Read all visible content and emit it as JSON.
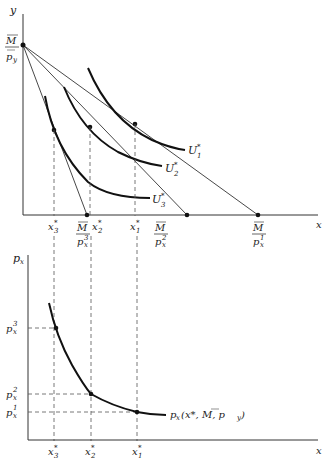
{
  "top_panel": {
    "y_axis_label": "y",
    "x_axis_label": "x",
    "y_intercept_label": {
      "num": "M",
      "den": "p",
      "den_sub": "y"
    },
    "budget_intercepts": [
      {
        "num": "M",
        "den": "p",
        "den_sub": "x",
        "den_sup": "3"
      },
      {
        "num": "M",
        "den": "p",
        "den_sub": "x",
        "den_sup": "2"
      },
      {
        "num": "M",
        "den": "p",
        "den_sub": "x",
        "den_sup": "1"
      }
    ],
    "indifference_curves": [
      {
        "label": "U",
        "sub": "1",
        "sup": "*"
      },
      {
        "label": "U",
        "sub": "2",
        "sup": "*"
      },
      {
        "label": "U",
        "sub": "3",
        "sup": "*"
      }
    ],
    "x_ticks": [
      {
        "label": "x",
        "sub": "3",
        "sup": "*"
      },
      {
        "label": "x",
        "sub": "2",
        "sup": "*"
      },
      {
        "label": "x",
        "sub": "1",
        "sup": "*"
      }
    ]
  },
  "bottom_panel": {
    "y_axis_label": "p",
    "y_axis_sub": "x",
    "x_axis_label": "x",
    "price_ticks": [
      {
        "label": "p",
        "sub": "x",
        "sup": "3"
      },
      {
        "label": "p",
        "sub": "x",
        "sup": "2"
      },
      {
        "label": "p",
        "sub": "x",
        "sup": "1"
      }
    ],
    "x_ticks": [
      {
        "label": "x",
        "sub": "3",
        "sup": "*"
      },
      {
        "label": "x",
        "sub": "2",
        "sup": "*"
      },
      {
        "label": "x",
        "sub": "1",
        "sup": "*"
      }
    ],
    "demand_label": "p",
    "demand_label_sub": "x",
    "demand_label_args": "(x*, M, p",
    "demand_label_args_sub": "y",
    "demand_label_close": ")"
  }
}
